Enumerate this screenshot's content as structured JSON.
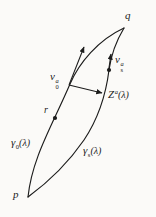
{
  "figure": {
    "type": "geodesic-variation-diagram",
    "colors": {
      "ink": "#1c1c1c",
      "paper": "#fbfaf8"
    },
    "points": {
      "q": "q",
      "p": "p",
      "r": "r"
    },
    "labels": {
      "v0": {
        "base": "v",
        "sup": "a",
        "sub": "0"
      },
      "vs": {
        "base": "v",
        "sup": "a",
        "sub": "s"
      },
      "z": {
        "base": "Z",
        "sup": "a",
        "arg": "(λ)"
      },
      "gamma0": {
        "base": "γ",
        "sub": "0",
        "arg": "(λ)"
      },
      "gammas": {
        "base": "γ",
        "sub": "s",
        "arg": "(λ)"
      }
    }
  }
}
